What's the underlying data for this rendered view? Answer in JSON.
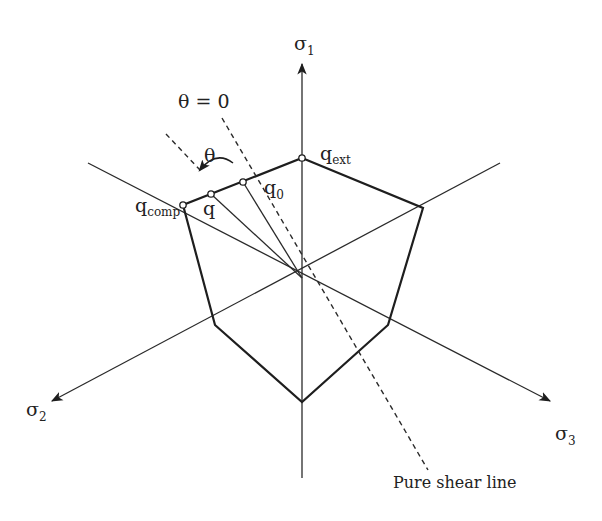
{
  "figure": {
    "type": "deviatoric-plane yield surface diagram",
    "axes": {
      "sigma1": {
        "symbol": "σ",
        "subscript": "1"
      },
      "sigma2": {
        "symbol": "σ",
        "subscript": "2"
      },
      "sigma3": {
        "symbol": "σ",
        "subscript": "3"
      }
    },
    "points": {
      "q_ext": {
        "symbol": "q",
        "subscript": "ext"
      },
      "q_comp": {
        "symbol": "q",
        "subscript": "comp"
      },
      "q_0": {
        "symbol": "q",
        "subscript": "0"
      },
      "q": {
        "symbol": "q",
        "subscript": ""
      }
    },
    "annotations": {
      "theta_zero": "θ = 0",
      "theta": "θ",
      "pure_shear": "Pure shear line"
    },
    "colors": {
      "line": "#1e1e1e",
      "background": "#ffffff"
    }
  }
}
